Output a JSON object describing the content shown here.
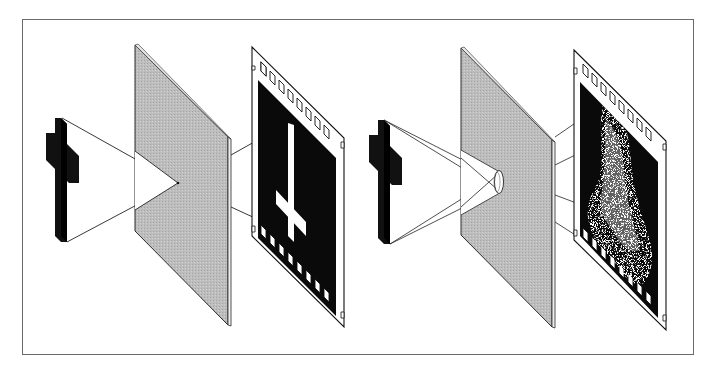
{
  "figure": {
    "title": "Pinhole vs. lens image formation on film",
    "background": "#ffffff",
    "frame_color": "#6a6a6a",
    "panel_fill": "#b8b8b8",
    "panel_edge": "#2a2a2a",
    "ink": "#111111",
    "film_base": "#ffffff",
    "film_emulsion": "#0a0a0a"
  },
  "scenes": [
    {
      "id": "pinhole",
      "label": "Pinhole camera",
      "object": "cross",
      "aperture": "pinhole",
      "image_on_film": "sharp inverted cross"
    },
    {
      "id": "lens",
      "label": "Lens camera",
      "object": "cross",
      "aperture": "lens",
      "image_on_film": "blurred diffuse image"
    }
  ]
}
